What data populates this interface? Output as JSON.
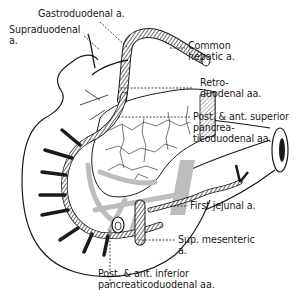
{
  "diagram": {
    "type": "anatomical illustration",
    "colors": {
      "ink": "#1a1a1a",
      "pancreas_shading": "#bdbdbd",
      "background": "#ffffff"
    },
    "labels": [
      {
        "id": "gastroduodenal",
        "lines": [
          "Gastroduodenal a."
        ]
      },
      {
        "id": "supraduodenal",
        "lines": [
          "Supraduodenal",
          "a."
        ]
      },
      {
        "id": "common_hepatic",
        "lines": [
          "Common",
          "hepatic a."
        ]
      },
      {
        "id": "retroduodenal",
        "lines": [
          "Retro-",
          "duodenal aa."
        ]
      },
      {
        "id": "sup_pancreaticoduodenal",
        "lines": [
          "Post. & ant. superior",
          "pancrea-",
          "ticoduodenal aa."
        ]
      },
      {
        "id": "first_jejunal",
        "lines": [
          "First jejunal a."
        ]
      },
      {
        "id": "sup_mesenteric",
        "lines": [
          "Sup. mesenteric",
          "a."
        ]
      },
      {
        "id": "inf_pancreaticoduodenal",
        "lines": [
          "Post. & ant. inferior",
          "pancreaticoduodenal aa."
        ]
      }
    ]
  }
}
